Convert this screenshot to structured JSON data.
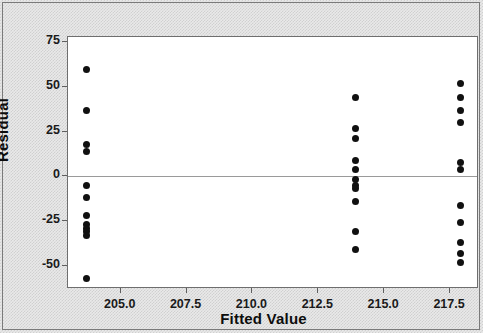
{
  "chart_data": {
    "type": "scatter",
    "title": "",
    "xlabel": "Fitted Value",
    "ylabel": "Residual",
    "xlim": [
      203.0,
      218.6
    ],
    "ylim": [
      -63,
      78
    ],
    "xticks": [
      "205.0",
      "207.5",
      "210.0",
      "212.5",
      "215.0",
      "217.5"
    ],
    "xtick_values": [
      205.0,
      207.5,
      210.0,
      212.5,
      215.0,
      217.5
    ],
    "yticks": [
      "75",
      "50",
      "25",
      "0",
      "-25",
      "-50"
    ],
    "ytick_values": [
      75,
      50,
      25,
      0,
      -25,
      -50
    ],
    "grid": false,
    "legend": null,
    "reference_lines": [
      {
        "axis": "y",
        "value": 0
      }
    ],
    "marker": {
      "shape": "circle",
      "color": "#111111",
      "size": 7
    },
    "series": [
      {
        "name": "Residuals",
        "points": [
          {
            "x": 203.7,
            "y": 60
          },
          {
            "x": 203.7,
            "y": 37
          },
          {
            "x": 203.7,
            "y": 18
          },
          {
            "x": 203.7,
            "y": 14
          },
          {
            "x": 203.7,
            "y": -5
          },
          {
            "x": 203.7,
            "y": -12
          },
          {
            "x": 203.7,
            "y": -22
          },
          {
            "x": 203.7,
            "y": -27
          },
          {
            "x": 203.7,
            "y": -29
          },
          {
            "x": 203.7,
            "y": -31
          },
          {
            "x": 203.7,
            "y": -33
          },
          {
            "x": 203.7,
            "y": -57
          },
          {
            "x": 213.9,
            "y": 44
          },
          {
            "x": 213.9,
            "y": 27
          },
          {
            "x": 213.9,
            "y": 21
          },
          {
            "x": 213.9,
            "y": 9
          },
          {
            "x": 213.9,
            "y": 4
          },
          {
            "x": 213.9,
            "y": -2
          },
          {
            "x": 213.9,
            "y": -5
          },
          {
            "x": 213.9,
            "y": -7
          },
          {
            "x": 213.9,
            "y": -14
          },
          {
            "x": 213.9,
            "y": -31
          },
          {
            "x": 213.9,
            "y": -41
          },
          {
            "x": 217.9,
            "y": 52
          },
          {
            "x": 217.9,
            "y": 44
          },
          {
            "x": 217.9,
            "y": 37
          },
          {
            "x": 217.9,
            "y": 30
          },
          {
            "x": 217.9,
            "y": 8
          },
          {
            "x": 217.9,
            "y": 4
          },
          {
            "x": 217.9,
            "y": -16
          },
          {
            "x": 217.9,
            "y": -26
          },
          {
            "x": 217.9,
            "y": -37
          },
          {
            "x": 217.9,
            "y": -43
          },
          {
            "x": 217.9,
            "y": -48
          }
        ]
      }
    ]
  }
}
